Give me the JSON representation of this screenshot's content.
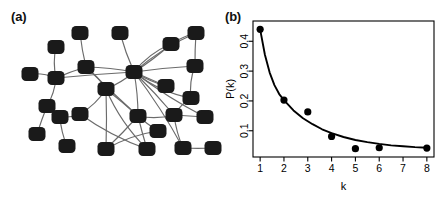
{
  "figure": {
    "panel_a": {
      "label": "(a)",
      "caption_name": "network-graph",
      "node_count": 28,
      "node_color": "#1a1a1a",
      "edge_color": "#6b6b6b",
      "background": "#ffffff",
      "nodes": [
        {
          "id": 0,
          "x": 30,
          "y": 74
        },
        {
          "id": 1,
          "x": 56,
          "y": 47
        },
        {
          "id": 2,
          "x": 56,
          "y": 78
        },
        {
          "id": 3,
          "x": 47,
          "y": 106
        },
        {
          "id": 4,
          "x": 37,
          "y": 134
        },
        {
          "id": 5,
          "x": 80,
          "y": 33
        },
        {
          "id": 6,
          "x": 86,
          "y": 67
        },
        {
          "id": 7,
          "x": 80,
          "y": 114
        },
        {
          "id": 8,
          "x": 67,
          "y": 146
        },
        {
          "id": 9,
          "x": 106,
          "y": 89
        },
        {
          "id": 10,
          "x": 106,
          "y": 149
        },
        {
          "id": 11,
          "x": 120,
          "y": 33
        },
        {
          "id": 12,
          "x": 134,
          "y": 72
        },
        {
          "id": 13,
          "x": 138,
          "y": 116
        },
        {
          "id": 14,
          "x": 147,
          "y": 149
        },
        {
          "id": 15,
          "x": 158,
          "y": 131
        },
        {
          "id": 16,
          "x": 171,
          "y": 44
        },
        {
          "id": 17,
          "x": 166,
          "y": 86
        },
        {
          "id": 18,
          "x": 174,
          "y": 115
        },
        {
          "id": 19,
          "x": 196,
          "y": 33
        },
        {
          "id": 20,
          "x": 195,
          "y": 66
        },
        {
          "id": 21,
          "x": 191,
          "y": 98
        },
        {
          "id": 22,
          "x": 205,
          "y": 117
        },
        {
          "id": 23,
          "x": 183,
          "y": 148
        },
        {
          "id": 24,
          "x": 213,
          "y": 148
        },
        {
          "id": 25,
          "x": 60,
          "y": 117
        }
      ],
      "edges": [
        [
          0,
          2
        ],
        [
          1,
          2
        ],
        [
          2,
          3
        ],
        [
          3,
          4
        ],
        [
          2,
          6
        ],
        [
          2,
          12
        ],
        [
          5,
          6
        ],
        [
          6,
          9
        ],
        [
          6,
          12
        ],
        [
          6,
          13
        ],
        [
          7,
          9
        ],
        [
          7,
          14
        ],
        [
          8,
          25
        ],
        [
          25,
          7
        ],
        [
          9,
          12
        ],
        [
          9,
          13
        ],
        [
          9,
          14
        ],
        [
          9,
          10
        ],
        [
          11,
          12
        ],
        [
          12,
          13
        ],
        [
          12,
          17
        ],
        [
          13,
          14
        ],
        [
          13,
          15
        ],
        [
          13,
          10
        ],
        [
          10,
          15
        ],
        [
          16,
          12
        ],
        [
          17,
          12
        ],
        [
          12,
          16
        ],
        [
          12,
          19
        ],
        [
          12,
          20
        ],
        [
          12,
          21
        ],
        [
          12,
          22
        ],
        [
          12,
          23
        ],
        [
          12,
          18
        ],
        [
          16,
          19
        ],
        [
          19,
          20
        ],
        [
          20,
          21
        ],
        [
          21,
          18
        ],
        [
          18,
          22
        ],
        [
          18,
          23
        ],
        [
          23,
          24
        ],
        [
          13,
          18
        ]
      ]
    },
    "panel_b": {
      "label": "(b)",
      "frame_color": "#000000",
      "point_color": "#000000",
      "curve_color": "#000000"
    }
  },
  "chart_data": {
    "type": "scatter",
    "title": "",
    "subtitle": "",
    "xlabel": "k",
    "ylabel": "P(k)",
    "x": [
      1,
      2,
      3,
      4,
      5,
      6,
      8
    ],
    "values": [
      0.44,
      0.203,
      0.163,
      0.081,
      0.04,
      0.043,
      0.042
    ],
    "series": [
      {
        "name": "observed degree distribution",
        "marker": "filled-circle",
        "x": [
          1,
          2,
          3,
          4,
          5,
          6,
          8
        ],
        "values": [
          0.44,
          0.203,
          0.163,
          0.081,
          0.04,
          0.043,
          0.042
        ]
      },
      {
        "name": "fitted power-law curve",
        "marker": "line",
        "x": [
          1.0,
          1.2,
          1.4,
          1.6,
          1.8,
          2.0,
          2.4,
          2.8,
          3.2,
          3.6,
          4.0,
          4.5,
          5.0,
          5.5,
          6.0,
          6.5,
          7.0,
          7.5,
          8.0
        ],
        "values": [
          0.44,
          0.355,
          0.295,
          0.253,
          0.223,
          0.203,
          0.168,
          0.142,
          0.122,
          0.105,
          0.092,
          0.079,
          0.069,
          0.062,
          0.056,
          0.051,
          0.048,
          0.045,
          0.043
        ]
      }
    ],
    "xticks": [
      1,
      2,
      3,
      4,
      5,
      6,
      7,
      8
    ],
    "xticklabels": [
      "1",
      "2",
      "3",
      "4",
      "5",
      "6",
      "7",
      "8"
    ],
    "yticks": [
      0.1,
      0.2,
      0.3,
      0.4
    ],
    "yticklabels": [
      "0.1",
      "0.2",
      "0.3",
      "0.4"
    ],
    "xlim": [
      0.7,
      8.3
    ],
    "ylim": [
      0.012,
      0.468
    ],
    "grid": false,
    "legend": "none",
    "ytick_label_rotation": -90
  }
}
